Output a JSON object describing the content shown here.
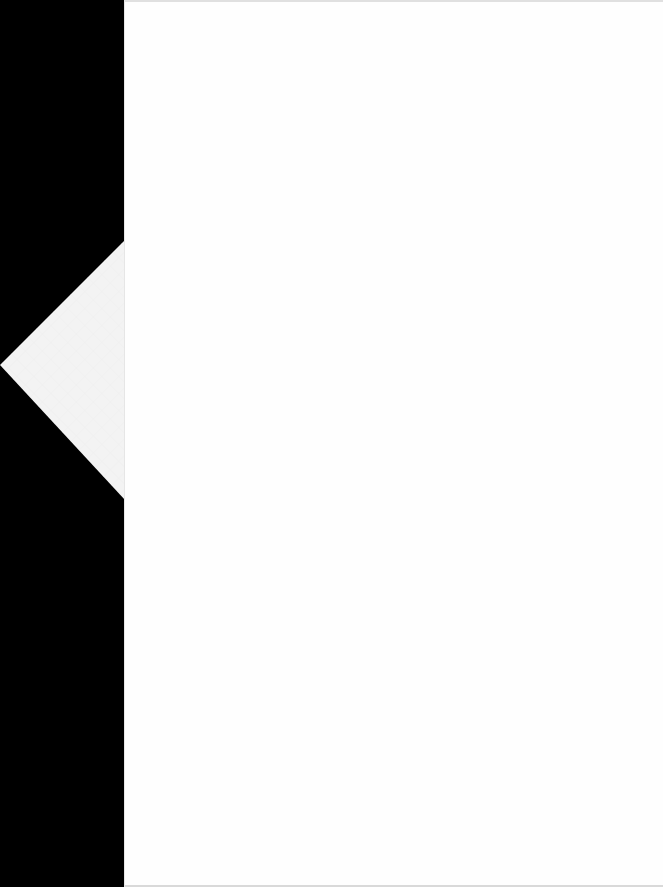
{
  "scene": {
    "background_color": "#000000",
    "page_color": "#fefefe",
    "flap_color": "#f2f2f2"
  },
  "page": {
    "content": ""
  },
  "flap": {
    "icon": "folded-corner-tab"
  }
}
